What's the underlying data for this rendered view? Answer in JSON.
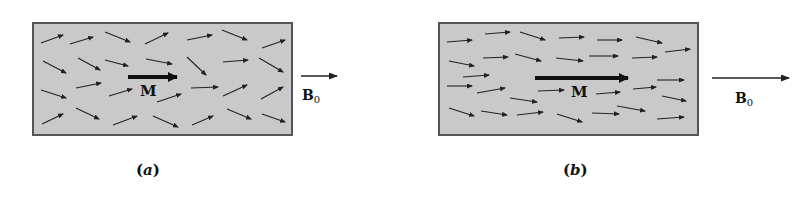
{
  "figure": {
    "colors": {
      "fill": "#c9c9c9",
      "border": "#555555",
      "arrow": "#222222",
      "text": "#111111"
    },
    "panels": [
      {
        "id": "a",
        "caption": "(a)",
        "box": {
          "x": 33,
          "y": 23,
          "w": 259,
          "h": 112
        },
        "magnetization_label": "M",
        "field_label": "B",
        "field_subscript": "0",
        "big_arrow": {
          "x1": 128,
          "y1": 77,
          "x2": 185,
          "y2": 77
        },
        "field_arrow": {
          "x1": 301,
          "y1": 76,
          "x2": 337,
          "y2": 76
        },
        "m_label_pos": {
          "x": 140,
          "y": 82
        },
        "b_label_pos": {
          "x": 302,
          "y": 87
        },
        "caption_pos": {
          "x": 136,
          "y": 161
        },
        "dipoles": [
          [
            41,
            43,
            63,
            35
          ],
          [
            70,
            44,
            93,
            37
          ],
          [
            105,
            32,
            130,
            42
          ],
          [
            145,
            44,
            168,
            33
          ],
          [
            187,
            40,
            212,
            35
          ],
          [
            222,
            30,
            247,
            40
          ],
          [
            262,
            48,
            285,
            40
          ],
          [
            43,
            61,
            66,
            73
          ],
          [
            78,
            58,
            100,
            70
          ],
          [
            105,
            60,
            128,
            66
          ],
          [
            146,
            59,
            172,
            64
          ],
          [
            187,
            57,
            206,
            75
          ],
          [
            223,
            62,
            248,
            60
          ],
          [
            259,
            58,
            283,
            72
          ],
          [
            41,
            90,
            66,
            98
          ],
          [
            76,
            88,
            101,
            83
          ],
          [
            109,
            96,
            132,
            89
          ],
          [
            157,
            102,
            181,
            94
          ],
          [
            191,
            88,
            218,
            87
          ],
          [
            223,
            96,
            247,
            85
          ],
          [
            261,
            99,
            283,
            87
          ],
          [
            42,
            124,
            63,
            114
          ],
          [
            76,
            108,
            99,
            119
          ],
          [
            113,
            125,
            137,
            116
          ],
          [
            153,
            116,
            178,
            127
          ],
          [
            192,
            125,
            213,
            116
          ],
          [
            227,
            109,
            251,
            119
          ],
          [
            262,
            114,
            285,
            122
          ]
        ]
      },
      {
        "id": "b",
        "caption": "(b)",
        "box": {
          "x": 439,
          "y": 23,
          "w": 259,
          "h": 112
        },
        "magnetization_label": "M",
        "field_label": "B",
        "field_subscript": "0",
        "big_arrow": {
          "x1": 535,
          "y1": 78,
          "x2": 636,
          "y2": 78
        },
        "field_arrow": {
          "x1": 712,
          "y1": 78,
          "x2": 789,
          "y2": 78
        },
        "m_label_pos": {
          "x": 571,
          "y": 83
        },
        "b_label_pos": {
          "x": 735,
          "y": 90
        },
        "caption_pos": {
          "x": 563,
          "y": 161
        },
        "dipoles": [
          [
            447,
            42,
            472,
            40
          ],
          [
            485,
            34,
            510,
            32
          ],
          [
            520,
            32,
            545,
            40
          ],
          [
            559,
            38,
            584,
            37
          ],
          [
            597,
            40,
            622,
            40
          ],
          [
            636,
            37,
            662,
            43
          ],
          [
            665,
            52,
            690,
            49
          ],
          [
            449,
            61,
            474,
            66
          ],
          [
            483,
            58,
            508,
            57
          ],
          [
            515,
            54,
            541,
            61
          ],
          [
            556,
            58,
            583,
            61
          ],
          [
            589,
            56,
            618,
            56
          ],
          [
            632,
            58,
            657,
            57
          ],
          [
            657,
            80,
            684,
            80
          ],
          [
            447,
            86,
            472,
            86
          ],
          [
            463,
            77,
            489,
            75
          ],
          [
            477,
            93,
            505,
            88
          ],
          [
            510,
            98,
            537,
            102
          ],
          [
            538,
            91,
            564,
            90
          ],
          [
            596,
            94,
            620,
            92
          ],
          [
            633,
            89,
            656,
            87
          ],
          [
            662,
            96,
            686,
            101
          ],
          [
            449,
            108,
            474,
            116
          ],
          [
            481,
            111,
            507,
            115
          ],
          [
            517,
            115,
            543,
            112
          ],
          [
            557,
            114,
            582,
            122
          ],
          [
            592,
            113,
            619,
            114
          ],
          [
            617,
            106,
            645,
            111
          ],
          [
            657,
            119,
            684,
            117
          ]
        ]
      }
    ]
  }
}
